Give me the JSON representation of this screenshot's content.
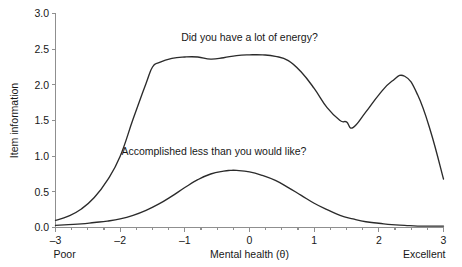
{
  "chart_data": {
    "type": "line",
    "title": "",
    "xlabel": "Mental health (θ)",
    "ylabel": "Item information",
    "xlim": [
      -3,
      3
    ],
    "ylim": [
      0.0,
      3.0
    ],
    "grid": false,
    "legend_position": "inline-annotations",
    "x_ticks": [
      "-3",
      "-2",
      "-1",
      "0",
      "1",
      "2",
      "3"
    ],
    "x_tick_values": [
      -3,
      -2,
      -1,
      0,
      1,
      2,
      3
    ],
    "y_ticks": [
      "0.0",
      "0.5",
      "1.0",
      "1.5",
      "2.0",
      "2.5",
      "3.0"
    ],
    "y_tick_values": [
      0.0,
      0.5,
      1.0,
      1.5,
      2.0,
      2.5,
      3.0
    ],
    "x_axis_end_labels": {
      "left": "Poor",
      "right": "Excellent"
    },
    "annotations": [
      {
        "text": "Did you have a lot of energy?",
        "x": 0.0,
        "y": 2.62,
        "series": "energy"
      },
      {
        "text": "Accomplished less than you would like?",
        "x": -0.55,
        "y": 1.02,
        "series": "accomplished"
      }
    ],
    "series": [
      {
        "name": "Did you have a lot of energy?",
        "color": "#2b2b2b",
        "x": [
          -3.0,
          -2.8,
          -2.6,
          -2.4,
          -2.2,
          -2.0,
          -1.8,
          -1.6,
          -1.5,
          -1.4,
          -1.2,
          -1.0,
          -0.8,
          -0.6,
          -0.4,
          -0.2,
          0.0,
          0.2,
          0.4,
          0.6,
          0.8,
          1.0,
          1.2,
          1.4,
          1.5,
          1.6,
          1.8,
          2.0,
          2.2,
          2.4,
          2.6,
          2.8,
          3.0
        ],
        "values": [
          0.1,
          0.16,
          0.26,
          0.42,
          0.66,
          1.0,
          1.52,
          2.02,
          2.25,
          2.31,
          2.37,
          2.39,
          2.39,
          2.36,
          2.38,
          2.41,
          2.42,
          2.42,
          2.4,
          2.34,
          2.18,
          1.95,
          1.68,
          1.5,
          1.48,
          1.4,
          1.62,
          1.86,
          2.05,
          2.12,
          1.86,
          1.35,
          0.68
        ]
      },
      {
        "name": "Accomplished less than you would like?",
        "color": "#2b2b2b",
        "x": [
          -3.0,
          -2.8,
          -2.6,
          -2.4,
          -2.2,
          -2.0,
          -1.8,
          -1.6,
          -1.4,
          -1.2,
          -1.0,
          -0.8,
          -0.6,
          -0.4,
          -0.3,
          -0.2,
          0.0,
          0.2,
          0.4,
          0.6,
          0.8,
          1.0,
          1.2,
          1.4,
          1.6,
          1.8,
          2.0,
          2.2,
          2.4,
          2.6,
          2.8,
          3.0
        ],
        "values": [
          0.03,
          0.04,
          0.05,
          0.07,
          0.09,
          0.12,
          0.17,
          0.24,
          0.33,
          0.44,
          0.56,
          0.67,
          0.75,
          0.79,
          0.8,
          0.8,
          0.78,
          0.73,
          0.66,
          0.56,
          0.45,
          0.34,
          0.25,
          0.17,
          0.12,
          0.08,
          0.06,
          0.04,
          0.03,
          0.02,
          0.02,
          0.02
        ]
      }
    ]
  }
}
